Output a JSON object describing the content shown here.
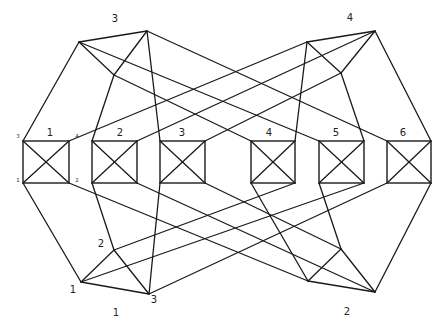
{
  "diagram": {
    "boxes": [
      {
        "label": "1",
        "x": 23,
        "y": 141,
        "w": 46,
        "h": 42,
        "corner_labels": {
          "tl": "3",
          "tr": "4",
          "bl": "1",
          "br": "2"
        }
      },
      {
        "label": "2",
        "x": 92,
        "y": 141,
        "w": 45,
        "h": 42
      },
      {
        "label": "3",
        "x": 160,
        "y": 141,
        "w": 45,
        "h": 42
      },
      {
        "label": "4",
        "x": 251,
        "y": 141,
        "w": 44,
        "h": 42
      },
      {
        "label": "5",
        "x": 319,
        "y": 141,
        "w": 45,
        "h": 42
      },
      {
        "label": "6",
        "x": 387,
        "y": 141,
        "w": 44,
        "h": 42
      }
    ],
    "groups": [
      {
        "label": "3",
        "position": "top-left",
        "label_pos": [
          115,
          22
        ],
        "nodes": [
          [
            79,
            42
          ],
          [
            147,
            31
          ],
          [
            114,
            75
          ]
        ]
      },
      {
        "label": "4",
        "position": "top-right",
        "label_pos": [
          350,
          21
        ],
        "nodes": [
          [
            307,
            42
          ],
          [
            375,
            31
          ],
          [
            341,
            73
          ]
        ]
      },
      {
        "label": "1",
        "position": "bottom-left",
        "label_pos": [
          116,
          316
        ],
        "nodes": [
          [
            81,
            282
          ],
          [
            114,
            250
          ],
          [
            149,
            294
          ]
        ],
        "node_labels": [
          "1",
          "2",
          "3"
        ]
      },
      {
        "label": "2",
        "position": "bottom-right",
        "label_pos": [
          347,
          315
        ],
        "nodes": [
          [
            308,
            281
          ],
          [
            341,
            249
          ],
          [
            375,
            292
          ]
        ]
      }
    ]
  }
}
